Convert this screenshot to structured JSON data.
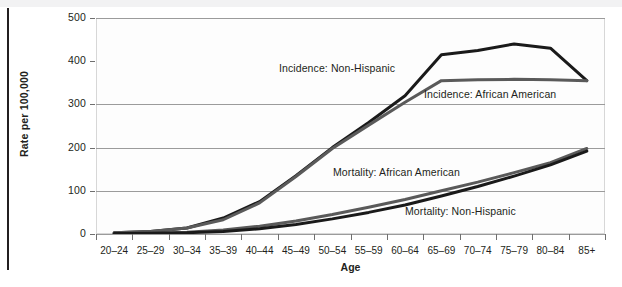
{
  "chart_data": {
    "type": "line",
    "title": "",
    "xlabel": "Age",
    "ylabel": "Rate per 100,000",
    "categories": [
      "20–24",
      "25–29",
      "30–34",
      "35–39",
      "40–44",
      "45–49",
      "50–54",
      "55–59",
      "60–64",
      "65–69",
      "70–74",
      "75–79",
      "80–84",
      "85+"
    ],
    "ylim": [
      0,
      500
    ],
    "yticks": [
      0,
      100,
      200,
      300,
      400,
      500
    ],
    "ytick_labels": [
      "0",
      "100",
      "200",
      "300",
      "400",
      "500"
    ],
    "grid": true,
    "grid_axis": "y",
    "legend_position": "inline-annotations",
    "series": [
      {
        "name": "Incidence: Non-Hispanic",
        "color": "#1a1a1a",
        "values": [
          3,
          6,
          14,
          37,
          75,
          135,
          200,
          258,
          320,
          415,
          425,
          440,
          430,
          355
        ]
      },
      {
        "name": "Incidence: African American",
        "color": "#5a5a5a",
        "values": [
          3,
          6,
          14,
          33,
          72,
          133,
          198,
          252,
          305,
          355,
          357,
          358,
          357,
          355
        ]
      },
      {
        "name": "Mortality: African American",
        "color": "#5a5a5a",
        "values": [
          1,
          2,
          4,
          9,
          18,
          30,
          45,
          62,
          80,
          100,
          120,
          142,
          165,
          198
        ]
      },
      {
        "name": "Mortality: Non-Hispanic",
        "color": "#1a1a1a",
        "values": [
          1,
          2,
          3,
          6,
          12,
          22,
          35,
          50,
          67,
          88,
          110,
          134,
          160,
          192
        ]
      }
    ],
    "annotations": [
      {
        "text": "Incidence: Non-Hispanic",
        "x": 279,
        "y": 62
      },
      {
        "text": "Incidence: African American",
        "x": 424,
        "y": 88
      },
      {
        "text": "Mortality: African American",
        "x": 333,
        "y": 166
      },
      {
        "text": "Mortality: Non-Hispanic",
        "x": 405,
        "y": 205
      }
    ]
  }
}
